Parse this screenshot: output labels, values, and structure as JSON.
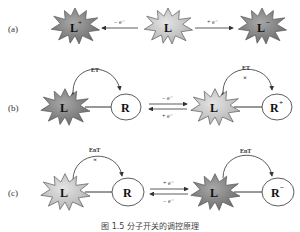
{
  "panels": {
    "a": {
      "label": "(a)",
      "left_star": "L",
      "left_star_sup": "+",
      "center_star": "L",
      "right_star": "L",
      "right_star_sup": "−",
      "left_arrow": "− e⁻",
      "right_arrow": "+ e⁻"
    },
    "b": {
      "label": "(b)",
      "left_star": "L",
      "left_circle": "R",
      "left_transfer": "ET",
      "top_arrow": "− e⁻",
      "bottom_arrow": "+ e⁻",
      "right_star": "L",
      "right_circle": "R",
      "right_circle_sup": "+",
      "right_transfer": "ET"
    },
    "c": {
      "label": "(c)",
      "left_star": "L",
      "left_circle": "R",
      "left_transfer": "EnT",
      "top_arrow": "+ e⁻",
      "bottom_arrow": "− e⁻",
      "right_star": "L",
      "right_circle": "R",
      "right_circle_sup": "−",
      "right_transfer": "EnT"
    }
  },
  "caption": "图 1.5 分子开关的调控原理",
  "colors": {
    "dark_star": "#8a8a8a",
    "light_star": "#c8c8c8",
    "stroke": "#333333"
  }
}
